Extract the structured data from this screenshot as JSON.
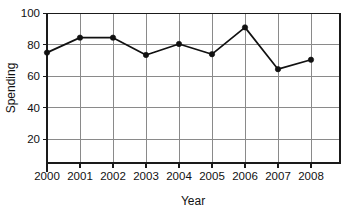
{
  "chart_data": {
    "type": "line",
    "title": "",
    "xlabel": "Year",
    "ylabel": "Spending",
    "categories": [
      "2000",
      "2001",
      "2002",
      "2003",
      "2004",
      "2005",
      "2006",
      "2007",
      "2008"
    ],
    "x": [
      2000,
      2001,
      2002,
      2003,
      2004,
      2005,
      2006,
      2007,
      2008
    ],
    "values": [
      75,
      84.5,
      84.5,
      73.5,
      80.5,
      74,
      91,
      64.5,
      70.5
    ],
    "series": [
      {
        "name": "Spending",
        "values": [
          75,
          84.5,
          84.5,
          73.5,
          80.5,
          74,
          91,
          64.5,
          70.5
        ],
        "color": "#111111",
        "marker": "filled-circle"
      }
    ],
    "ylim": [
      0,
      100
    ],
    "xlim": [
      2000,
      2009
    ],
    "yticks": [
      20,
      40,
      60,
      80,
      100
    ],
    "ytick_labels": [
      "20",
      "40",
      "60",
      "80",
      "100"
    ],
    "xtick_labels": [
      "2000",
      "2001",
      "2002",
      "2003",
      "2004",
      "2005",
      "2006",
      "2007",
      "2008"
    ],
    "grid": true,
    "grid_color": "#8a8a8a",
    "legend": "none",
    "legend_position": "none",
    "frame_color": "#1a1a1a",
    "background": "#ffffff"
  }
}
